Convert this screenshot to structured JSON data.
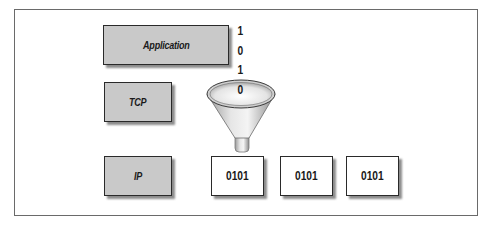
{
  "diagram": {
    "type": "protocol-stack-encapsulation",
    "layers": [
      {
        "label": "Application"
      },
      {
        "label": "TCP"
      },
      {
        "label": "IP"
      }
    ],
    "bitstream": [
      "1",
      "0",
      "1",
      "0"
    ],
    "packets": [
      {
        "label": "0101"
      },
      {
        "label": "0101"
      },
      {
        "label": "0101"
      }
    ],
    "funnel": {
      "icon": "funnel-icon"
    },
    "colors": {
      "layer_fill": "#c9c9c9",
      "border": "#2a2a2a",
      "packet_fill": "#ffffff",
      "frame_border": "#6a6a6a"
    }
  }
}
